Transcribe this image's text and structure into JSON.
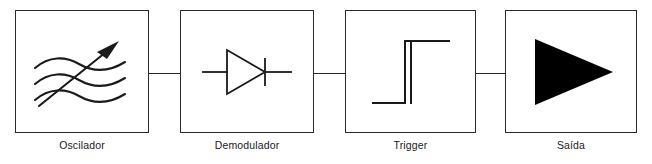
{
  "diagram": {
    "language": "pt-BR",
    "background_color": "#ffffff",
    "line_color": "#2a2a2a",
    "fill_color": "#000000",
    "blocks": [
      {
        "id": "oscilador",
        "label": "Oscilador",
        "symbol": "wavy-lines-with-arrow-icon",
        "x": 15,
        "y": 10,
        "width": 134,
        "height": 123
      },
      {
        "id": "demodulador",
        "label": "Demodulador",
        "symbol": "diode-icon",
        "x": 180,
        "y": 10,
        "width": 134,
        "height": 123
      },
      {
        "id": "trigger",
        "label": "Trigger",
        "symbol": "step-waveform-icon",
        "x": 345,
        "y": 10,
        "width": 131,
        "height": 123
      },
      {
        "id": "saida",
        "label": "Saída",
        "symbol": "filled-triangle-output-icon",
        "x": 505,
        "y": 10,
        "width": 132,
        "height": 123
      }
    ],
    "connectors": [
      {
        "id": "oscilador-to-demodulador",
        "x": 149,
        "y": 73,
        "length": 31
      },
      {
        "id": "demodulador-to-trigger",
        "x": 314,
        "y": 73,
        "length": 31
      },
      {
        "id": "trigger-to-saida",
        "x": 476,
        "y": 73,
        "length": 29
      }
    ]
  }
}
